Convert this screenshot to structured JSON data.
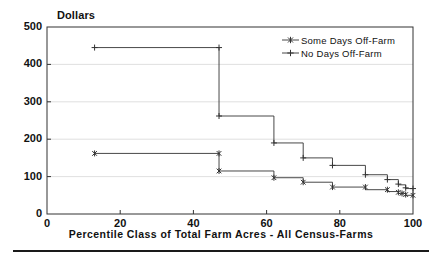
{
  "chart_data": {
    "type": "line",
    "subtype": "step",
    "title": "",
    "ylabel": "Dollars",
    "xlabel": "Percentile Class of Total Farm Acres - All Census-Farms",
    "xlim": [
      0,
      100
    ],
    "ylim": [
      0,
      500
    ],
    "xticks": [
      0,
      20,
      40,
      60,
      80,
      100
    ],
    "yticks": [
      0,
      100,
      200,
      300,
      400,
      500
    ],
    "grid": true,
    "grid_axis": "y",
    "legend_position": "top-right",
    "series": [
      {
        "name": "Some Days Off-Farm",
        "marker": "asterisk",
        "color": "#333333",
        "points": [
          {
            "x": 13,
            "y": 162
          },
          {
            "x": 47,
            "y": 162
          },
          {
            "x": 47,
            "y": 115
          },
          {
            "x": 62,
            "y": 115
          },
          {
            "x": 62,
            "y": 97
          },
          {
            "x": 70,
            "y": 97
          },
          {
            "x": 70,
            "y": 85
          },
          {
            "x": 78,
            "y": 85
          },
          {
            "x": 78,
            "y": 72
          },
          {
            "x": 87,
            "y": 72
          },
          {
            "x": 87,
            "y": 65
          },
          {
            "x": 93,
            "y": 65
          },
          {
            "x": 93,
            "y": 60
          },
          {
            "x": 96,
            "y": 60
          },
          {
            "x": 96,
            "y": 55
          },
          {
            "x": 98,
            "y": 55
          },
          {
            "x": 98,
            "y": 50
          },
          {
            "x": 100,
            "y": 50
          }
        ],
        "markers": [
          {
            "x": 13,
            "y": 162
          },
          {
            "x": 47,
            "y": 162
          },
          {
            "x": 47,
            "y": 115
          },
          {
            "x": 62,
            "y": 97
          },
          {
            "x": 70,
            "y": 85
          },
          {
            "x": 78,
            "y": 72
          },
          {
            "x": 87,
            "y": 72
          },
          {
            "x": 93,
            "y": 65
          },
          {
            "x": 96,
            "y": 58
          },
          {
            "x": 97,
            "y": 55
          },
          {
            "x": 98,
            "y": 52
          },
          {
            "x": 100,
            "y": 50
          }
        ]
      },
      {
        "name": "No Days Off-Farm",
        "marker": "plus",
        "color": "#333333",
        "points": [
          {
            "x": 13,
            "y": 445
          },
          {
            "x": 47,
            "y": 445
          },
          {
            "x": 47,
            "y": 262
          },
          {
            "x": 62,
            "y": 262
          },
          {
            "x": 62,
            "y": 190
          },
          {
            "x": 70,
            "y": 190
          },
          {
            "x": 70,
            "y": 150
          },
          {
            "x": 78,
            "y": 150
          },
          {
            "x": 78,
            "y": 130
          },
          {
            "x": 87,
            "y": 130
          },
          {
            "x": 87,
            "y": 105
          },
          {
            "x": 93,
            "y": 105
          },
          {
            "x": 93,
            "y": 92
          },
          {
            "x": 96,
            "y": 92
          },
          {
            "x": 96,
            "y": 78
          },
          {
            "x": 98,
            "y": 78
          },
          {
            "x": 98,
            "y": 68
          },
          {
            "x": 100,
            "y": 68
          }
        ],
        "markers": [
          {
            "x": 13,
            "y": 445
          },
          {
            "x": 47,
            "y": 445
          },
          {
            "x": 47,
            "y": 262
          },
          {
            "x": 62,
            "y": 190
          },
          {
            "x": 70,
            "y": 150
          },
          {
            "x": 78,
            "y": 130
          },
          {
            "x": 87,
            "y": 105
          },
          {
            "x": 93,
            "y": 92
          },
          {
            "x": 96,
            "y": 80
          },
          {
            "x": 98,
            "y": 70
          },
          {
            "x": 100,
            "y": 68
          }
        ]
      }
    ]
  },
  "legend": {
    "items": [
      {
        "label": "Some Days Off-Farm",
        "marker": "asterisk"
      },
      {
        "label": "No Days Off-Farm",
        "marker": "plus"
      }
    ]
  },
  "colors": {
    "axis": "#333333",
    "grid": "#d8d8d8",
    "series": "#333333",
    "text": "#111111",
    "rule": "#1a1a1a"
  }
}
